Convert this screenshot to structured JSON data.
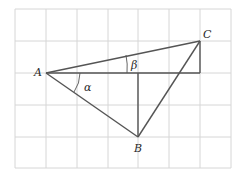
{
  "diagram": {
    "grid": {
      "x_lines": [
        15,
        46,
        77,
        108,
        138,
        169,
        200,
        231
      ],
      "y_lines": [
        9,
        41,
        73,
        105,
        137,
        168
      ],
      "color": "#d6d6d6"
    },
    "points": {
      "A": {
        "label": "A",
        "x": 46,
        "y": 73
      },
      "B": {
        "label": "B",
        "x": 138,
        "y": 137
      },
      "C": {
        "label": "C",
        "x": 200,
        "y": 41
      }
    },
    "angles": {
      "alpha": {
        "label": "α"
      },
      "beta": {
        "label": "β"
      }
    },
    "line_color": "#555555"
  }
}
